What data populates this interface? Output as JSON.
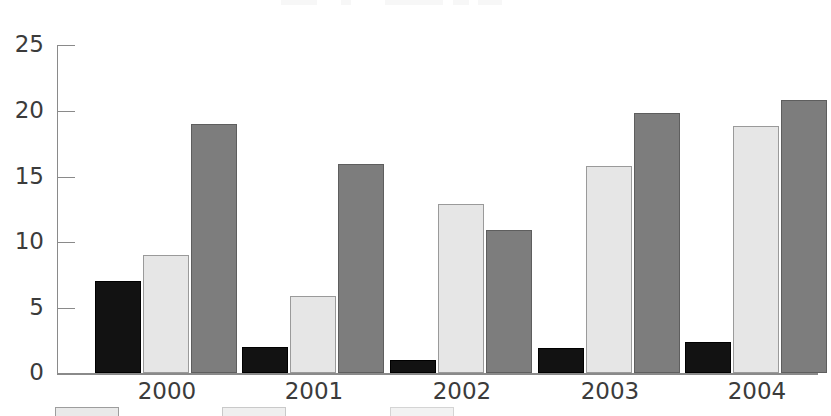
{
  "chart_data": {
    "type": "bar",
    "title": "",
    "xlabel": "",
    "ylabel": "",
    "ylim": [
      0,
      25
    ],
    "yticks": [
      0,
      5,
      10,
      15,
      20,
      25
    ],
    "grid": false,
    "legend_position": "bottom",
    "categories": [
      "2000",
      "2001",
      "2002",
      "2003",
      "2004"
    ],
    "series": [
      {
        "name": "Series 1",
        "color": "#121212",
        "values": [
          7.0,
          2.0,
          1.0,
          1.9,
          2.4
        ]
      },
      {
        "name": "Series 2",
        "color": "#e6e6e6",
        "values": [
          9.0,
          5.9,
          12.9,
          15.8,
          18.8
        ]
      },
      {
        "name": "Series 3",
        "color": "#7d7d7d",
        "values": [
          19.0,
          15.9,
          10.9,
          19.8,
          20.8
        ]
      }
    ]
  },
  "axis": {
    "y_tick_labels": [
      "25",
      "20",
      "15",
      "10",
      "5",
      "0"
    ]
  },
  "legend": {
    "items": [
      {
        "label": ""
      },
      {
        "label": ""
      },
      {
        "label": ""
      }
    ]
  }
}
